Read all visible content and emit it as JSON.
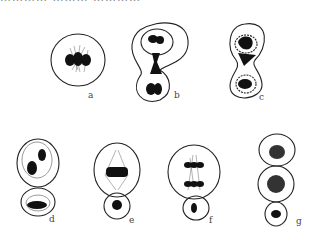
{
  "figure": {
    "top_cut_text": "………… ……… …………",
    "panels": [
      {
        "id": "a",
        "label": "a",
        "x": 90,
        "y": 97,
        "stage": "metaphase (mother cell, spindle with chromosomes at equator)"
      },
      {
        "id": "b",
        "label": "b",
        "x": 176,
        "y": 97,
        "stage": "nucleus migrating into bud neck"
      },
      {
        "id": "c",
        "label": "c",
        "x": 261,
        "y": 97,
        "stage": "chromatin dividing between mother and bud"
      },
      {
        "id": "d",
        "label": "d",
        "x": 51,
        "y": 221,
        "stage": "two nuclei, mother and bud"
      },
      {
        "id": "e",
        "label": "e",
        "x": 131,
        "y": 221,
        "stage": "metaphase in mother, bud nucleus"
      },
      {
        "id": "f",
        "label": "f",
        "x": 211,
        "y": 221,
        "stage": "anaphase in mother, bud nucleus"
      },
      {
        "id": "g",
        "label": "g",
        "x": 288,
        "y": 221,
        "stage": "chain of three cells with nuclei"
      }
    ]
  }
}
